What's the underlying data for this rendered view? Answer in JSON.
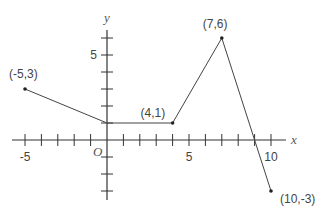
{
  "chart_data": {
    "type": "line",
    "title": "",
    "xlabel": "x",
    "ylabel": "y",
    "origin_label": "O",
    "xlim": [
      -5.5,
      11
    ],
    "ylim": [
      -3.5,
      7
    ],
    "grid": false,
    "x_ticks": [
      -5,
      -4,
      -3,
      -2,
      -1,
      1,
      2,
      3,
      4,
      5,
      6,
      7,
      8,
      9,
      10
    ],
    "y_ticks": [
      -3,
      -2,
      -1,
      1,
      2,
      3,
      4,
      5,
      6
    ],
    "x_tick_labels": [
      {
        "value": -5,
        "label": "-5"
      },
      {
        "value": 5,
        "label": "5"
      },
      {
        "value": 10,
        "label": "10"
      }
    ],
    "y_tick_labels": [
      {
        "value": 5,
        "label": "5"
      }
    ],
    "series": [
      {
        "name": "piecewise",
        "points": [
          {
            "x": -5,
            "y": 3,
            "label": "(-5,3)"
          },
          {
            "x": 0,
            "y": 1,
            "label": ""
          },
          {
            "x": 4,
            "y": 1,
            "label": "(4,1)"
          },
          {
            "x": 7,
            "y": 6,
            "label": "(7,6)"
          },
          {
            "x": 10,
            "y": -3,
            "label": "(10,-3)"
          }
        ]
      }
    ]
  }
}
